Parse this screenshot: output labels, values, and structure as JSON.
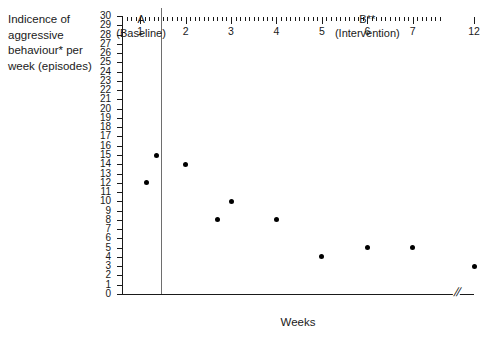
{
  "chart_data": {
    "type": "scatter",
    "title": "",
    "xlabel": "Weeks",
    "ylabel": "Indicence of\naggressive\nbehaviour* per\nweek (episodes)",
    "xlim": [
      0.6,
      12.4
    ],
    "ylim": [
      0,
      30
    ],
    "grid": false,
    "legend": "none",
    "x_tick_labels": [
      "1",
      "2",
      "3",
      "4",
      "5",
      "6",
      "7",
      "12"
    ],
    "x_tick_values": [
      1,
      2,
      3,
      4,
      5,
      6,
      7,
      12
    ],
    "x_minor_tick_step": 0.1,
    "axis_break": {
      "label": "//",
      "between": [
        7.6,
        12
      ]
    },
    "y_tick_labels": [
      "30",
      "29",
      "28",
      "27",
      "26",
      "25",
      "24",
      "23",
      "22",
      "21",
      "20",
      "19",
      "18",
      "17",
      "16",
      "15",
      "14",
      "13",
      "12",
      "11",
      "10",
      "9",
      "8",
      "7",
      "6",
      "5",
      "4",
      "3",
      "2",
      "1",
      "0"
    ],
    "y_tick_values": [
      30,
      29,
      28,
      27,
      26,
      25,
      24,
      23,
      22,
      21,
      20,
      19,
      18,
      17,
      16,
      15,
      14,
      13,
      12,
      11,
      10,
      9,
      8,
      7,
      6,
      5,
      4,
      3,
      2,
      1,
      0
    ],
    "series": [
      {
        "name": "Incidence of aggressive behaviour",
        "marker": "filled-circle",
        "color": "#000000",
        "points": [
          {
            "x": 1.15,
            "y": 12,
            "phase": "A"
          },
          {
            "x": 1.35,
            "y": 15,
            "phase": "A"
          },
          {
            "x": 2.0,
            "y": 14,
            "phase": "B"
          },
          {
            "x": 2.7,
            "y": 8,
            "phase": "B"
          },
          {
            "x": 3.0,
            "y": 10,
            "phase": "B"
          },
          {
            "x": 4.0,
            "y": 8,
            "phase": "B"
          },
          {
            "x": 5.0,
            "y": 4,
            "phase": "B"
          },
          {
            "x": 6.0,
            "y": 5,
            "phase": "B"
          },
          {
            "x": 7.0,
            "y": 5,
            "phase": "B"
          },
          {
            "x": 12.0,
            "y": 3,
            "phase": "B"
          }
        ]
      }
    ],
    "phases": [
      {
        "id": "A",
        "label": "A\n(Baseline)",
        "center_x": 1.02
      },
      {
        "id": "B",
        "label": "B**\n(Intervention)",
        "center_x": 6.0
      }
    ],
    "phase_change_line": {
      "x": 1.45,
      "color": "#6e6e6e"
    }
  },
  "axis_labels": {
    "y_title": "Indicence of\naggressive\nbehaviour* per\nweek (episodes)",
    "x_title": "Weeks"
  }
}
